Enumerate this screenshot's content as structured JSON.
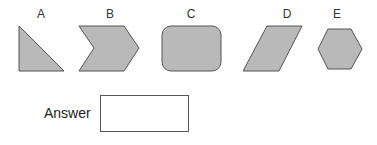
{
  "options": [
    {
      "letter": "A",
      "shape": "right-triangle"
    },
    {
      "letter": "B",
      "shape": "chevron"
    },
    {
      "letter": "C",
      "shape": "rounded-rectangle"
    },
    {
      "letter": "D",
      "shape": "parallelogram"
    },
    {
      "letter": "E",
      "shape": "hexagon"
    }
  ],
  "answer": {
    "label": "Answer",
    "value": "",
    "placeholder": ""
  },
  "colors": {
    "shape_fill": "#b9b9b9",
    "shape_stroke": "#555555"
  }
}
